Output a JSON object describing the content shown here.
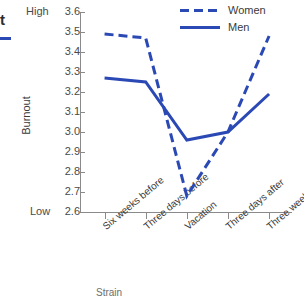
{
  "title_fragment": "t",
  "subtitle_fragment": "",
  "axis_anchors": {
    "high": "High",
    "low": "Low"
  },
  "legend": {
    "items": [
      {
        "label": "Women",
        "style": "dashed",
        "color": "#2b49b5"
      },
      {
        "label": "Men",
        "style": "solid",
        "color": "#2b49b5"
      }
    ]
  },
  "xaxis_title": "Strain",
  "chart_data": {
    "type": "line",
    "title": "",
    "xlabel": "",
    "ylabel": "Burnout",
    "categories": [
      "Six weeks before",
      "Three days before",
      "Vacation",
      "Three days after",
      "Three weeks after"
    ],
    "series": [
      {
        "name": "Women",
        "style": "dashed",
        "color": "#2b49b5",
        "values": [
          3.49,
          3.47,
          2.68,
          3.0,
          3.48
        ]
      },
      {
        "name": "Men",
        "style": "solid",
        "color": "#2b49b5",
        "values": [
          3.27,
          3.25,
          2.96,
          3.0,
          3.19
        ]
      }
    ],
    "ylim": [
      2.6,
      3.6
    ],
    "yticks": [
      "3.6",
      "3.5",
      "3.4",
      "3.3",
      "3.2",
      "3.1",
      "3.0",
      "2.9",
      "2.8",
      "2.7",
      "2.6"
    ],
    "ytick_values": [
      3.6,
      3.5,
      3.4,
      3.3,
      3.2,
      3.1,
      3.0,
      2.9,
      2.8,
      2.7,
      2.6
    ],
    "grid": false,
    "legend_position": "top-right",
    "anchor_high": "High",
    "anchor_low": "Low"
  }
}
